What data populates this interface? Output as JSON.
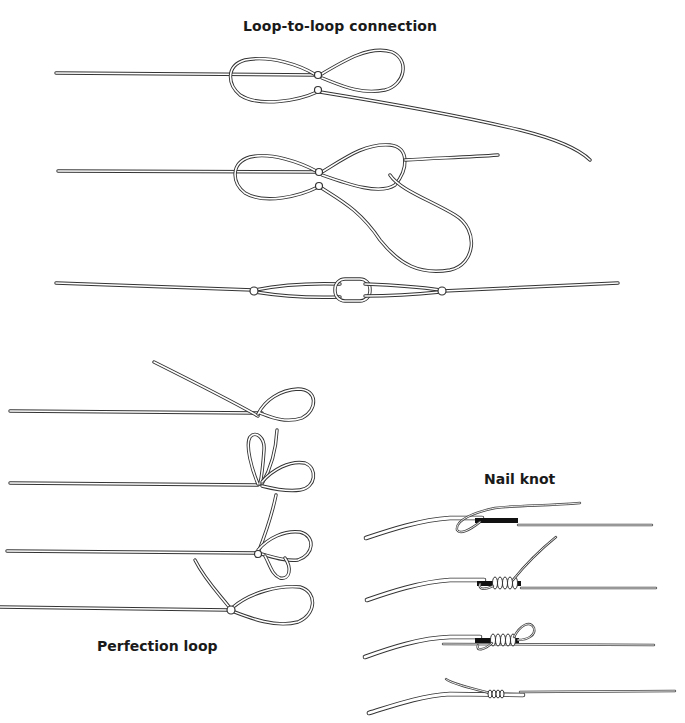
{
  "titles": {
    "loop_to_loop": "Loop-to-loop connection",
    "perfection_loop": "Perfection loop",
    "nail_knot": "Nail knot"
  },
  "sections": [
    {
      "id": "loop-to-loop",
      "label": "Loop-to-loop connection",
      "steps": 3
    },
    {
      "id": "perfection-loop",
      "label": "Perfection loop",
      "steps": 4
    },
    {
      "id": "nail-knot",
      "label": "Nail knot",
      "steps": 4
    }
  ],
  "colors": {
    "line": "#333333",
    "background": "#ffffff",
    "text": "#1a1a1a",
    "nail": "#111111"
  }
}
